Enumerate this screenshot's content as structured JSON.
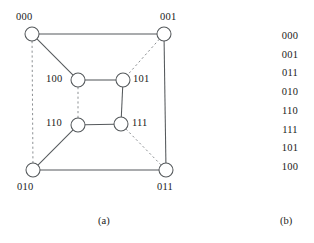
{
  "figure": {
    "panel_a": {
      "caption": "(a)",
      "caption_pos": {
        "x": 98,
        "y": 215
      },
      "type": "hypercube-graph",
      "nodes": [
        {
          "id": "n000",
          "label": "000",
          "cx": 32,
          "cy": 34,
          "r": 7,
          "label_x": 16,
          "label_y": 11,
          "label_anchor": "above-left"
        },
        {
          "id": "n001",
          "label": "001",
          "cx": 164,
          "cy": 34,
          "r": 7,
          "label_x": 160,
          "label_y": 11,
          "label_anchor": "above-right"
        },
        {
          "id": "n100",
          "label": "100",
          "cx": 78,
          "cy": 80,
          "r": 7,
          "label_x": 46,
          "label_y": 73,
          "label_anchor": "left"
        },
        {
          "id": "n101",
          "label": "101",
          "cx": 123,
          "cy": 80,
          "r": 7,
          "label_x": 133,
          "label_y": 73,
          "label_anchor": "right"
        },
        {
          "id": "n110",
          "label": "110",
          "cx": 78,
          "cy": 125,
          "r": 7,
          "label_x": 46,
          "label_y": 117,
          "label_anchor": "left"
        },
        {
          "id": "n111",
          "label": "111",
          "cx": 121,
          "cy": 124,
          "r": 7,
          "label_x": 132,
          "label_y": 117,
          "label_anchor": "right"
        },
        {
          "id": "n010",
          "label": "010",
          "cx": 33,
          "cy": 170,
          "r": 7,
          "label_x": 17,
          "label_y": 181,
          "label_anchor": "below-left"
        },
        {
          "id": "n011",
          "label": "011",
          "cx": 166,
          "cy": 170,
          "r": 7,
          "label_x": 157,
          "label_y": 181,
          "label_anchor": "below-right"
        }
      ],
      "edges": [
        {
          "from": "n000",
          "to": "n001",
          "style": "solid"
        },
        {
          "from": "n000",
          "to": "n100",
          "style": "solid"
        },
        {
          "from": "n000",
          "to": "n010",
          "style": "dashed"
        },
        {
          "from": "n001",
          "to": "n011",
          "style": "solid"
        },
        {
          "from": "n001",
          "to": "n101",
          "style": "dashed"
        },
        {
          "from": "n100",
          "to": "n101",
          "style": "solid"
        },
        {
          "from": "n100",
          "to": "n110",
          "style": "dashed"
        },
        {
          "from": "n101",
          "to": "n111",
          "style": "solid"
        },
        {
          "from": "n110",
          "to": "n111",
          "style": "solid"
        },
        {
          "from": "n110",
          "to": "n010",
          "style": "solid"
        },
        {
          "from": "n010",
          "to": "n011",
          "style": "solid"
        },
        {
          "from": "n111",
          "to": "n011",
          "style": "dashed"
        }
      ]
    },
    "panel_b": {
      "caption": "(b)",
      "caption_pos": {
        "x": 280,
        "y": 215
      },
      "type": "gray-code-sequence",
      "items": [
        "000",
        "001",
        "011",
        "010",
        "110",
        "111",
        "101",
        "100"
      ]
    },
    "colors": {
      "stroke": "#55595c",
      "dashed_stroke": "#8d9194",
      "node_fill": "#ffffff",
      "text": "#1a1a1a",
      "background": "#ffffff"
    }
  }
}
